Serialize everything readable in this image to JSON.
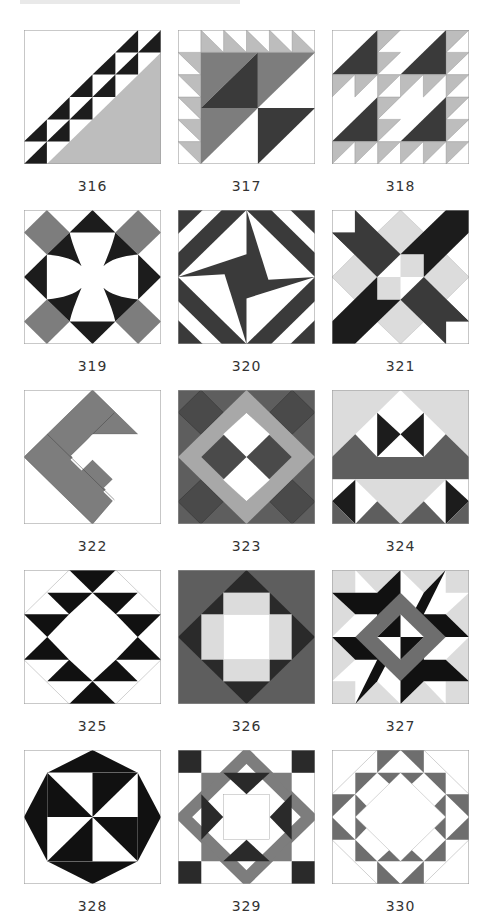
{
  "page": {
    "colors": {
      "black": "#1c1c1c",
      "dark": "#3a3a3a",
      "mid": "#7d7d7d",
      "light": "#bdbdbd",
      "pale": "#dcdcdc",
      "white": "#ffffff",
      "line": "#9a9a9a"
    }
  },
  "blocks": [
    {
      "number": "316",
      "x": 24,
      "y": 30
    },
    {
      "number": "317",
      "x": 178,
      "y": 30
    },
    {
      "number": "318",
      "x": 332,
      "y": 30
    },
    {
      "number": "319",
      "x": 24,
      "y": 210
    },
    {
      "number": "320",
      "x": 178,
      "y": 210
    },
    {
      "number": "321",
      "x": 332,
      "y": 210
    },
    {
      "number": "322",
      "x": 24,
      "y": 390
    },
    {
      "number": "323",
      "x": 178,
      "y": 390
    },
    {
      "number": "324",
      "x": 332,
      "y": 390
    },
    {
      "number": "325",
      "x": 24,
      "y": 570
    },
    {
      "number": "326",
      "x": 178,
      "y": 570
    },
    {
      "number": "327",
      "x": 332,
      "y": 570
    },
    {
      "number": "328",
      "x": 24,
      "y": 750
    },
    {
      "number": "329",
      "x": 178,
      "y": 750
    },
    {
      "number": "330",
      "x": 332,
      "y": 750
    }
  ]
}
